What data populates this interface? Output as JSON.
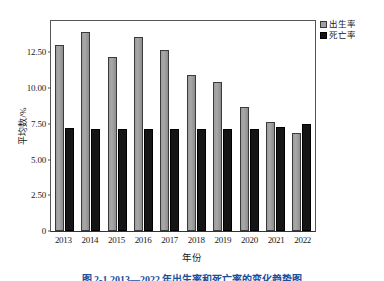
{
  "chart_data": {
    "type": "bar",
    "title": "",
    "xlabel": "年份",
    "ylabel": "平均数/%",
    "categories": [
      "2013",
      "2014",
      "2015",
      "2016",
      "2017",
      "2018",
      "2019",
      "2020",
      "2021",
      "2022"
    ],
    "series": [
      {
        "name": "出生率",
        "color": "#a0a0a0",
        "values": [
          13.05,
          13.95,
          12.15,
          13.6,
          12.7,
          10.9,
          10.45,
          8.65,
          7.6,
          6.85
        ]
      },
      {
        "name": "死亡率",
        "color": "#151515",
        "values": [
          7.2,
          7.15,
          7.15,
          7.15,
          7.15,
          7.15,
          7.15,
          7.15,
          7.3,
          7.5
        ]
      }
    ],
    "ylim": [
      0,
      14.7
    ],
    "yticks": [
      0,
      2.5,
      5.0,
      7.5,
      10.0,
      12.5
    ],
    "ytick_labels": [
      "0",
      "2.50",
      "5.00",
      "7.50",
      "10.00",
      "12.50"
    ],
    "grid": false,
    "legend_position": "top-right"
  },
  "legend": {
    "items": [
      {
        "label": "出生率"
      },
      {
        "label": "死亡率"
      }
    ]
  },
  "caption": {
    "text": "图 2-1  2013—2022 年出生率和死亡率的变化趋势图"
  }
}
